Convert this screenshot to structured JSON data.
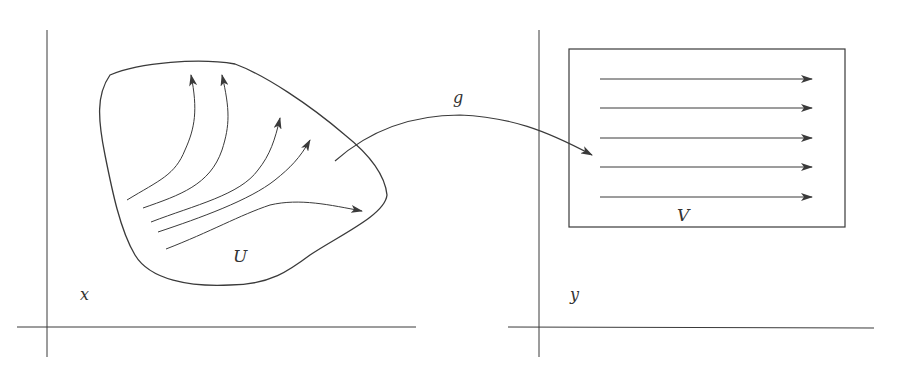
{
  "diagram": {
    "type": "flow-box-rectification",
    "colors": {
      "line": "#3a3a3a",
      "text": "#333333",
      "background": "#ffffff"
    },
    "left_panel": {
      "axis_label": "x",
      "region_label": "U",
      "flow_lines": 5
    },
    "map": {
      "label": "g"
    },
    "right_panel": {
      "axis_label": "y",
      "region_label": "V",
      "flow_lines": 5
    }
  }
}
